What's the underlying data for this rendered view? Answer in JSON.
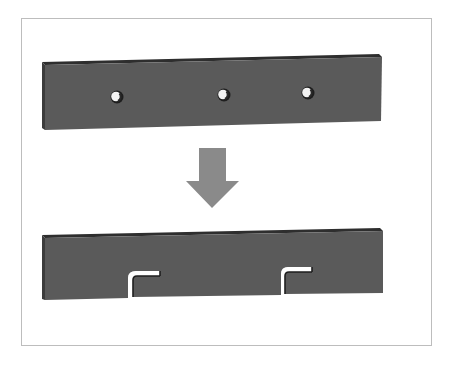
{
  "diagram": {
    "colors": {
      "background": "#ffffff",
      "frame_border": "#bdbdbd",
      "bar_face": "#5a5a5a",
      "bar_top_edge": "#2e2e2e",
      "bar_side_edge": "#3a3a3a",
      "arrow": "#8a8a8a",
      "hole_highlight": "#f2f2f2"
    },
    "top_bar": {
      "label": "",
      "holes": [
        {
          "cx": 117,
          "cy": 97
        },
        {
          "cx": 224,
          "cy": 95
        },
        {
          "cx": 308,
          "cy": 93
        }
      ]
    },
    "arrow": {
      "direction": "down"
    },
    "bottom_bar": {
      "label": "",
      "slots": [
        {
          "x": 128
        },
        {
          "x": 281
        }
      ]
    }
  }
}
